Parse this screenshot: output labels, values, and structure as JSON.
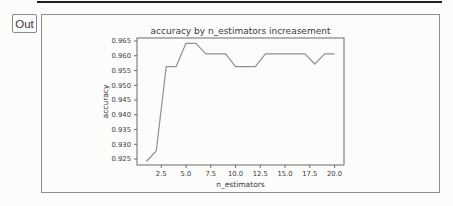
{
  "notebook": {
    "out_label": "Out"
  },
  "colors": {
    "background": "#fcfcfa",
    "divider": "#1f1f1f",
    "box_border": "#8f8f8f",
    "out_border": "#8a8a8a",
    "axes_border": "#6b6b6b",
    "line": "#909090",
    "text": "#3a3a3a"
  },
  "chart_data": {
    "type": "line",
    "title": "accuracy by n_estimators increasement",
    "xlabel": "n_estimators",
    "ylabel": "accuracy",
    "x": [
      1,
      2,
      3,
      4,
      5,
      6,
      7,
      8,
      9,
      10,
      11,
      12,
      13,
      14,
      15,
      16,
      17,
      18,
      19,
      20
    ],
    "y": [
      0.9242,
      0.9278,
      0.9563,
      0.9563,
      0.9642,
      0.9642,
      0.9606,
      0.9606,
      0.9606,
      0.9563,
      0.9563,
      0.9563,
      0.9606,
      0.9606,
      0.9606,
      0.9606,
      0.9606,
      0.9572,
      0.9606,
      0.9606
    ],
    "xlim": [
      0.05,
      20.95
    ],
    "ylim": [
      0.923,
      0.966
    ],
    "xticks": [
      2.5,
      5.0,
      7.5,
      10.0,
      12.5,
      15.0,
      17.5,
      20.0
    ],
    "yticks": [
      0.925,
      0.93,
      0.935,
      0.94,
      0.945,
      0.95,
      0.955,
      0.96,
      0.965
    ],
    "grid": false,
    "legend": null,
    "line_color": "#909090"
  }
}
